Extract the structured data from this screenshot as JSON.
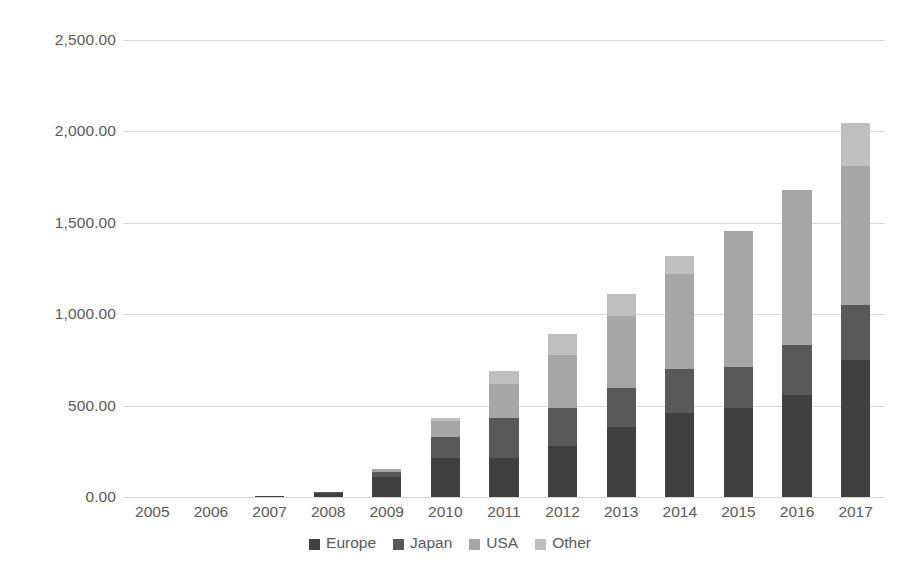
{
  "chart_data": {
    "type": "bar",
    "stacked": true,
    "title": "",
    "subtitle": "",
    "xlabel": "",
    "ylabel": "",
    "ylim": [
      0,
      2500
    ],
    "ytick_values": [
      0,
      500,
      1000,
      1500,
      2000,
      2500
    ],
    "ytick_labels": [
      "0.00",
      "500.00",
      "1,000.00",
      "1,500.00",
      "2,000.00",
      "2,500.00"
    ],
    "grid": true,
    "legend_position": "bottom",
    "categories": [
      "2005",
      "2006",
      "2007",
      "2008",
      "2009",
      "2010",
      "2011",
      "2012",
      "2013",
      "2014",
      "2015",
      "2016",
      "2017"
    ],
    "series": [
      {
        "name": "Europe",
        "color": "#404040",
        "values": [
          0,
          0,
          3,
          22,
          110,
          215,
          213,
          279,
          382,
          459,
          486,
          558,
          750
        ]
      },
      {
        "name": "Japan",
        "color": "#595959",
        "values": [
          0,
          0,
          0,
          5,
          28,
          113,
          217,
          208,
          213,
          240,
          228,
          273,
          300
        ]
      },
      {
        "name": "USA",
        "color": "#a6a6a6",
        "values": [
          0,
          0,
          0,
          0,
          13,
          86,
          191,
          291,
          398,
          519,
          742,
          849,
          760
        ]
      },
      {
        "name": "Other",
        "color": "#bfbfbf",
        "values": [
          0,
          0,
          0,
          0,
          0,
          17,
          69,
          112,
          115,
          100,
          0,
          0,
          235
        ]
      }
    ],
    "totals": [
      0,
      0,
      3,
      27,
      151,
      431,
      690,
      890,
      1108,
      1318,
      1456,
      1680,
      2045
    ]
  },
  "legend": {
    "items": [
      {
        "label": "Europe",
        "color": "#404040",
        "swatch_name": "legend-swatch-europe"
      },
      {
        "label": "Japan",
        "color": "#595959",
        "swatch_name": "legend-swatch-japan"
      },
      {
        "label": "USA",
        "color": "#a6a6a6",
        "swatch_name": "legend-swatch-usa"
      },
      {
        "label": "Other",
        "color": "#bfbfbf",
        "swatch_name": "legend-swatch-other"
      }
    ]
  },
  "style": {
    "background": "#ffffff",
    "gridline_color": "#d9d9d9",
    "text_color": "#5a5a5a"
  }
}
